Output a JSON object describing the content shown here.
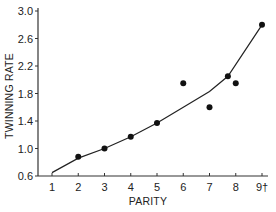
{
  "chart_data": {
    "type": "scatter",
    "title": "",
    "xlabel": "PARITY",
    "ylabel": "TWINNING RATE",
    "xlim": [
      1,
      9
    ],
    "ylim": [
      0.6,
      3.0
    ],
    "grid": false,
    "legend": null,
    "x_ticks": [
      {
        "value": 1,
        "label": "1"
      },
      {
        "value": 2,
        "label": "2"
      },
      {
        "value": 3,
        "label": "3"
      },
      {
        "value": 4,
        "label": "4"
      },
      {
        "value": 5,
        "label": "5"
      },
      {
        "value": 6,
        "label": "6"
      },
      {
        "value": 7,
        "label": "7"
      },
      {
        "value": 8,
        "label": "8"
      },
      {
        "value": 9,
        "label": "9†"
      }
    ],
    "y_ticks": [
      {
        "value": 0.6,
        "label": "0.6"
      },
      {
        "value": 1.0,
        "label": "1.0"
      },
      {
        "value": 1.4,
        "label": "1.4"
      },
      {
        "value": 1.8,
        "label": "1.8"
      },
      {
        "value": 2.2,
        "label": "2.2"
      },
      {
        "value": 2.6,
        "label": "2.6"
      },
      {
        "value": 3.0,
        "label": "3.0"
      }
    ],
    "series": [
      {
        "name": "observed",
        "type": "scatter",
        "x": [
          2,
          3,
          4,
          5,
          6,
          7,
          7.7,
          8,
          9
        ],
        "y": [
          0.88,
          1.0,
          1.17,
          1.37,
          1.95,
          1.6,
          2.05,
          1.95,
          2.8
        ]
      },
      {
        "name": "fitted",
        "type": "line",
        "x": [
          1,
          2,
          3,
          4,
          5,
          6,
          7,
          7.7,
          9
        ],
        "y": [
          0.65,
          0.86,
          1.0,
          1.17,
          1.37,
          1.6,
          1.83,
          2.05,
          2.8
        ]
      }
    ]
  }
}
